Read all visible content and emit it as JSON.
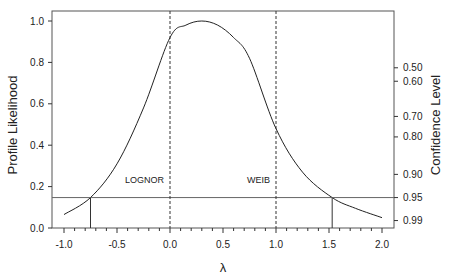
{
  "chart_data": {
    "type": "line",
    "title": "",
    "xlabel": "λ",
    "ylabel": "Profile Likelihood",
    "ylabel_right": "Confidence Level",
    "xlim": [
      -1.1,
      2.1
    ],
    "ylim": [
      0.0,
      1.05
    ],
    "x_ticks": [
      "-1.0",
      "-0.5",
      "0.0",
      "0.5",
      "1.0",
      "1.5",
      "2.0"
    ],
    "y_ticks": [
      "0.0",
      "0.2",
      "0.4",
      "0.6",
      "0.8",
      "1.0"
    ],
    "right_ticks": [
      {
        "label": "0.50",
        "likelihood": 0.774
      },
      {
        "label": "0.60",
        "likelihood": 0.709
      },
      {
        "label": "0.70",
        "likelihood": 0.539
      },
      {
        "label": "0.80",
        "likelihood": 0.44
      },
      {
        "label": "0.90",
        "likelihood": 0.259
      },
      {
        "label": "0.95",
        "likelihood": 0.147
      },
      {
        "label": "0.99",
        "likelihood": 0.036
      }
    ],
    "grid": false,
    "series": [
      {
        "name": "Profile Likelihood",
        "x": [
          -1.0,
          -0.75,
          -0.5,
          -0.25,
          0.0,
          0.15,
          0.3,
          0.45,
          0.6,
          0.75,
          1.0,
          1.25,
          1.53,
          1.75,
          2.0
        ],
        "y": [
          0.065,
          0.147,
          0.31,
          0.58,
          0.92,
          0.98,
          1.0,
          0.98,
          0.92,
          0.82,
          0.48,
          0.27,
          0.147,
          0.095,
          0.05
        ]
      }
    ],
    "reference_lines": {
      "horizontal": {
        "y": 0.147,
        "label": "95% cutoff"
      },
      "vertical_dashed": [
        {
          "x": 0.0,
          "label": "LOGNOR"
        },
        {
          "x": 1.0,
          "label": "WEIB"
        }
      ],
      "vertical_solid": [
        {
          "x": -0.75
        },
        {
          "x": 1.53
        }
      ]
    },
    "annotations": [
      "LOGNOR",
      "WEIB"
    ]
  }
}
